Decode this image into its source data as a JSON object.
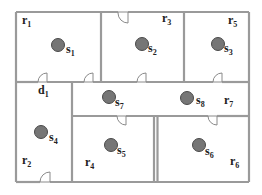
{
  "diagram": {
    "title": "",
    "rooms": [
      {
        "id": "r1",
        "base": "r",
        "sub": "1",
        "x": 22,
        "y": 24
      },
      {
        "id": "r3",
        "base": "r",
        "sub": "3",
        "x": 162,
        "y": 22
      },
      {
        "id": "r5",
        "base": "r",
        "sub": "5",
        "x": 228,
        "y": 24
      },
      {
        "id": "r7",
        "base": "r",
        "sub": "7",
        "x": 224,
        "y": 104
      },
      {
        "id": "r2",
        "base": "r",
        "sub": "2",
        "x": 22,
        "y": 164
      },
      {
        "id": "r4",
        "base": "r",
        "sub": "4",
        "x": 85,
        "y": 166
      },
      {
        "id": "r6",
        "base": "r",
        "sub": "6",
        "x": 230,
        "y": 165
      }
    ],
    "doors_labels": [
      {
        "id": "d1",
        "base": "d",
        "sub": "1",
        "x": 38,
        "y": 94
      }
    ],
    "sensors": [
      {
        "id": "s1",
        "base": "s",
        "sub": "1",
        "cx": 58,
        "cy": 45,
        "lx": 66,
        "ly": 53
      },
      {
        "id": "s2",
        "base": "s",
        "sub": "2",
        "cx": 142,
        "cy": 44,
        "lx": 148,
        "ly": 52
      },
      {
        "id": "s3",
        "base": "s",
        "sub": "3",
        "cx": 218,
        "cy": 44,
        "lx": 224,
        "ly": 52
      },
      {
        "id": "s4",
        "base": "s",
        "sub": "4",
        "cx": 41,
        "cy": 132,
        "lx": 49,
        "ly": 141
      },
      {
        "id": "s5",
        "base": "s",
        "sub": "5",
        "cx": 111,
        "cy": 145,
        "lx": 117,
        "ly": 154
      },
      {
        "id": "s6",
        "base": "s",
        "sub": "6",
        "cx": 199,
        "cy": 145,
        "lx": 205,
        "ly": 155
      },
      {
        "id": "s7",
        "base": "s",
        "sub": "7",
        "cx": 109,
        "cy": 97,
        "lx": 115,
        "ly": 106
      },
      {
        "id": "s8",
        "base": "s",
        "sub": "8",
        "cx": 187,
        "cy": 98,
        "lx": 196,
        "ly": 104
      }
    ],
    "colors": {
      "wall": "#9a9a9a",
      "sensor_fill": "#767676",
      "sensor_stroke": "#4a4a4a",
      "label": "#222222"
    }
  }
}
